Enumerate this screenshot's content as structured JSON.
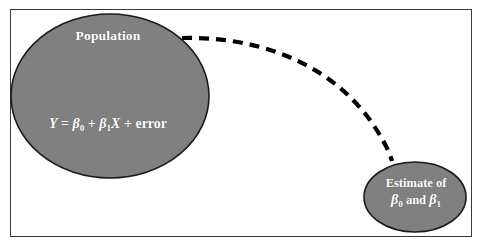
{
  "figure": {
    "type": "concept-diagram",
    "background_color": "#ffffff",
    "frame": {
      "border_color": "#3a3a3a",
      "x": 10,
      "y": 9,
      "width": 462,
      "height": 228
    },
    "node_fill_color": "#808080",
    "node_stroke_color": "#1a1a1a",
    "label_color": "#ffffff",
    "connector_color": "#000000"
  },
  "nodes": {
    "population": {
      "name": "population-ellipse",
      "title": "Population",
      "formula_y": "Y",
      "formula_eq": " = ",
      "formula_beta0": "β",
      "formula_sub0": "0",
      "formula_plus1": " + ",
      "formula_beta1": "β",
      "formula_sub1": "1",
      "formula_x": "X",
      "formula_plus2": " + ",
      "formula_error": "error",
      "formula_plain": "Y = β0 + β1X + error",
      "cx": 110,
      "cy": 96,
      "rx": 99,
      "ry": 82
    },
    "estimate": {
      "name": "estimate-ellipse",
      "line1": "Estimate of",
      "beta0": "β",
      "sub0": "0",
      "and": " and ",
      "beta1": "β",
      "sub1": "1",
      "line2_plain": "β0 and β1",
      "cx": 415,
      "cy": 197,
      "rx": 51,
      "ry": 35
    }
  },
  "connector": {
    "name": "dashed-curve-connector",
    "style": "dashed",
    "dash_length": 10,
    "dash_gap": 7,
    "stroke_width": 4.2,
    "path": "M 182 38 C 268 36, 340 70, 378 132 C 386 145, 390 154, 392 161",
    "from": "population",
    "to": "estimate"
  }
}
